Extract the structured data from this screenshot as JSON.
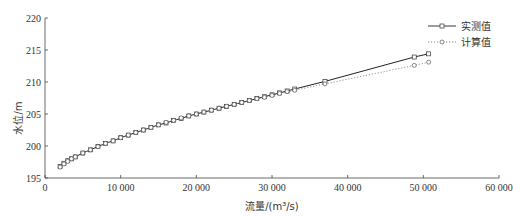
{
  "chart_data": {
    "type": "line",
    "title": "",
    "xlabel": "流量/(m³/s)",
    "ylabel": "水位/m",
    "xlim": [
      0,
      60000
    ],
    "ylim": [
      195,
      220
    ],
    "x_ticks": [
      0,
      10000,
      20000,
      30000,
      40000,
      50000,
      60000
    ],
    "x_tick_labels": [
      "0",
      "10 000",
      "20 000",
      "30 000",
      "40 000",
      "50 000",
      "60 000"
    ],
    "y_ticks": [
      195,
      200,
      205,
      210,
      215,
      220
    ],
    "y_tick_labels": [
      "195",
      "200",
      "205",
      "210",
      "215",
      "220"
    ],
    "grid": false,
    "legend_position": "upper right",
    "series": [
      {
        "name": "实测值",
        "style": "solid",
        "marker": "square",
        "x": [
          2000,
          2500,
          3000,
          3500,
          4000,
          5000,
          6000,
          7000,
          8000,
          9000,
          10000,
          11000,
          12000,
          13000,
          14000,
          15000,
          16000,
          17000,
          18000,
          19000,
          20000,
          21000,
          22000,
          23000,
          24000,
          25000,
          26000,
          27000,
          28000,
          29000,
          30000,
          31000,
          32000,
          33000,
          37000,
          48800,
          50700
        ],
        "y": [
          196.8,
          197.3,
          197.7,
          198.0,
          198.3,
          198.9,
          199.4,
          199.9,
          200.4,
          200.8,
          201.3,
          201.7,
          202.1,
          202.5,
          202.9,
          203.3,
          203.6,
          204.0,
          204.3,
          204.7,
          205.0,
          205.3,
          205.6,
          205.9,
          206.2,
          206.5,
          206.8,
          207.1,
          207.4,
          207.7,
          208.0,
          208.3,
          208.6,
          208.9,
          210.1,
          213.9,
          214.4
        ]
      },
      {
        "name": "计算值",
        "style": "dotted",
        "marker": "circle",
        "x": [
          2000,
          2500,
          3000,
          3500,
          4000,
          5000,
          6000,
          7000,
          8000,
          9000,
          10000,
          11000,
          12000,
          13000,
          14000,
          15000,
          16000,
          17000,
          18000,
          19000,
          20000,
          21000,
          22000,
          23000,
          24000,
          25000,
          26000,
          27000,
          28000,
          29000,
          30000,
          31000,
          32000,
          33000,
          37000,
          48800,
          50700
        ],
        "y": [
          196.7,
          197.2,
          197.6,
          198.0,
          198.3,
          198.9,
          199.4,
          199.9,
          200.4,
          200.8,
          201.3,
          201.7,
          202.1,
          202.5,
          202.9,
          203.3,
          203.7,
          204.0,
          204.4,
          204.7,
          205.0,
          205.3,
          205.6,
          205.9,
          206.2,
          206.5,
          206.8,
          207.1,
          207.4,
          207.6,
          207.9,
          208.2,
          208.5,
          208.7,
          209.7,
          212.6,
          213.1
        ]
      }
    ]
  },
  "legend": {
    "items": [
      {
        "label": "实测值"
      },
      {
        "label": "计算值"
      }
    ]
  }
}
